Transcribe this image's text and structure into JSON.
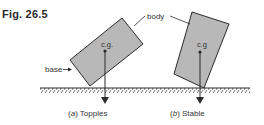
{
  "figure": {
    "title": "Fig. 26.5",
    "labels": {
      "body": "body",
      "base": "base",
      "cg_a": "c.g.",
      "cg_b": "c.g"
    },
    "captions": {
      "a_prefix": "(",
      "a_letter": "a",
      "a_text": ") Topples",
      "b_prefix": "(",
      "b_letter": "b",
      "b_text": ") Stable"
    },
    "colors": {
      "block_fill": "#b8b8b8",
      "stroke": "#2b2b2b",
      "text": "#333333"
    }
  }
}
